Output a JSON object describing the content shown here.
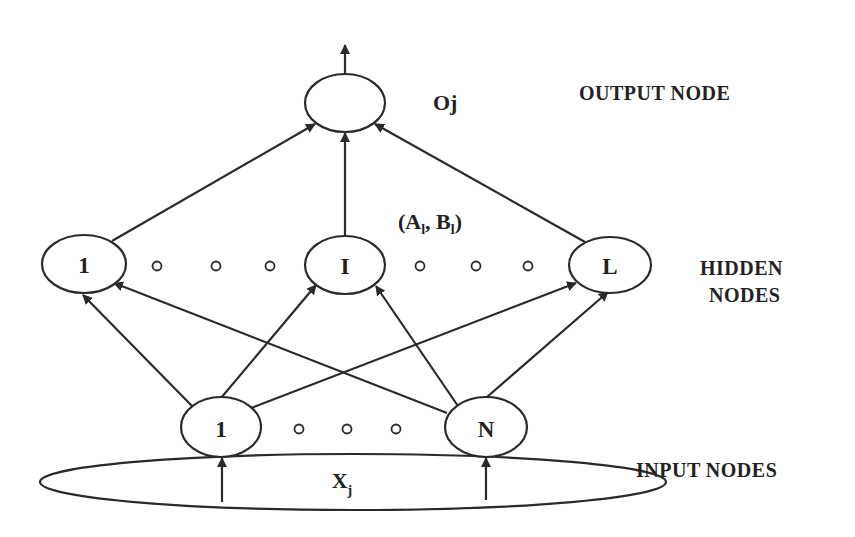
{
  "diagram": {
    "colors": {
      "stroke": "#2a2a2a",
      "text": "#222222",
      "background": "#ffffff"
    },
    "layers": {
      "output": {
        "label": "OUTPUT NODE",
        "nodes": [
          {
            "id": "out",
            "label": ""
          }
        ],
        "node_annotation": "Oj"
      },
      "hidden": {
        "label_line1": "HIDDEN",
        "label_line2": "NODES",
        "nodes": [
          {
            "id": "h1",
            "label": "1"
          },
          {
            "id": "hI",
            "label": "I"
          },
          {
            "id": "hL",
            "label": "L"
          }
        ],
        "ellipsis": "○ ○ ○",
        "parameter_annotation": {
          "open": "(A",
          "sub1": "l",
          "mid": ", B",
          "sub2": "l",
          "close": ")"
        }
      },
      "input": {
        "label": "INPUT NODES",
        "nodes": [
          {
            "id": "i1",
            "label": "1"
          },
          {
            "id": "iN",
            "label": "N"
          }
        ],
        "ellipsis": "○ ○ ○",
        "input_vector": {
          "base": "X",
          "sub": "j"
        }
      }
    },
    "edges": [
      {
        "from": "X",
        "to": "i1"
      },
      {
        "from": "X",
        "to": "iN"
      },
      {
        "from": "i1",
        "to": "h1"
      },
      {
        "from": "i1",
        "to": "hI"
      },
      {
        "from": "i1",
        "to": "hL"
      },
      {
        "from": "iN",
        "to": "h1"
      },
      {
        "from": "iN",
        "to": "hI"
      },
      {
        "from": "iN",
        "to": "hL"
      },
      {
        "from": "h1",
        "to": "out"
      },
      {
        "from": "hI",
        "to": "out"
      },
      {
        "from": "hL",
        "to": "out"
      },
      {
        "from": "out",
        "to": "output"
      }
    ]
  }
}
